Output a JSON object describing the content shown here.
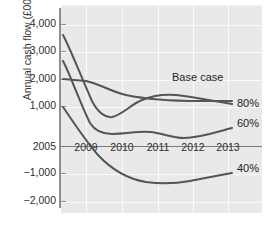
{
  "chart_data": {
    "type": "line",
    "title": "",
    "xlabel": "",
    "ylabel": "Annual cash flow (£000)",
    "xlim": [
      2005,
      2013.5
    ],
    "ylim": [
      -2400,
      4500
    ],
    "grid": true,
    "legend_position": "inline-right-of-series",
    "y_ticks": [
      {
        "value": 4000,
        "label": "4,000",
        "y_px": 24
      },
      {
        "value": 3000,
        "label": "3,000",
        "y_px": 51
      },
      {
        "value": 2000,
        "label": "2,000",
        "y_px": 79
      },
      {
        "value": 1000,
        "label": "1,000",
        "y_px": 106
      },
      {
        "value": 0,
        "label": "2005",
        "y_px": 147
      },
      {
        "value": -1000,
        "label": "−1,000",
        "y_px": 173
      },
      {
        "value": -2000,
        "label": "−2,000",
        "y_px": 201
      }
    ],
    "x_ticks": [
      {
        "value": 2009,
        "label": "2009",
        "x_px": 86
      },
      {
        "value": 2010,
        "label": "2010",
        "x_px": 122
      },
      {
        "value": 2011,
        "label": "2011",
        "x_px": 158
      },
      {
        "value": 2012,
        "label": "2012",
        "x_px": 193
      },
      {
        "value": 2013,
        "label": "2013",
        "x_px": 228
      }
    ],
    "x_tick_label_y_px": 141,
    "series": [
      {
        "name": "Base case",
        "label": "Base case",
        "label_x_px": 172,
        "label_y_px": 78,
        "color": "#555555",
        "x": [
          2005,
          2007,
          2009,
          2010,
          2011,
          2012,
          2012.7
        ],
        "values": [
          2000,
          1980,
          1900,
          1780,
          1700,
          1690,
          1700
        ],
        "path": "M 63 79 L 86 81 C 100 84, 112 92, 126 95 C 150 100, 170 101, 200 101 L 232 101"
      },
      {
        "name": "80%",
        "label": "80%",
        "label_x_px": 237,
        "label_y_px": 104,
        "color": "#555555",
        "x": [
          2005,
          2009,
          2009.7,
          2010.3,
          2011.2,
          2012,
          2012.7
        ],
        "values": [
          3550,
          900,
          800,
          1000,
          1250,
          1180,
          1100
        ],
        "path": "M 63 35 C 70 48, 80 74, 92 101 C 98 113, 106 118, 112 117 C 122 115, 130 105, 142 100 C 154 95, 166 94, 176 95 C 194 97, 212 101, 232 104"
      },
      {
        "name": "60%",
        "label": "60%",
        "label_x_px": 237,
        "label_y_px": 124,
        "color": "#555555",
        "x": [
          2005,
          2009,
          2009.6,
          2010.5,
          2011.5,
          2012.2,
          2012.7
        ],
        "values": [
          2550,
          620,
          560,
          600,
          440,
          480,
          550
        ],
        "path": "M 63 61 C 70 74, 80 103, 90 123 C 95 131, 102 134, 112 134 C 126 134, 138 131, 150 132 C 162 133, 172 138, 184 138 C 200 138, 216 132, 232 128"
      },
      {
        "name": "40%",
        "label": "40%",
        "label_x_px": 237,
        "label_y_px": 169,
        "color": "#555555",
        "x": [
          2005,
          2008,
          2009.5,
          2010.5,
          2011.5,
          2012.3,
          2012.7
        ],
        "values": [
          950,
          -100,
          -600,
          -950,
          -1150,
          -1120,
          -1050
        ],
        "path": "M 63 107 C 72 120, 84 139, 98 155 C 112 170, 128 179, 146 182 C 160 184, 174 184, 190 181 C 206 178, 220 175, 232 173"
      }
    ]
  },
  "axis": {
    "y_title": "Annual cash flow (£000)"
  }
}
